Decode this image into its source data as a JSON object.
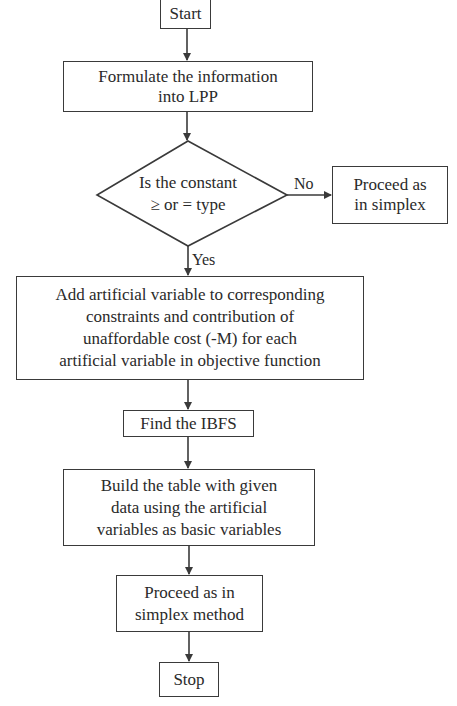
{
  "diagram": {
    "type": "flowchart",
    "nodes": {
      "start": {
        "label": "Start",
        "shape": "rectangle"
      },
      "formulate": {
        "label": "Formulate the information into LPP",
        "lines": [
          "Formulate the information",
          "into LPP"
        ],
        "shape": "rectangle"
      },
      "decision": {
        "label": "Is the constant ≥ or = type",
        "lines": [
          "Is the constant",
          "≥ or = type"
        ],
        "shape": "diamond"
      },
      "proceed_simplex": {
        "label": "Proceed as in simplex",
        "lines": [
          "Proceed as",
          "in simplex"
        ],
        "shape": "rectangle"
      },
      "add_artificial": {
        "label": "Add artificial variable to corresponding constraints and contribution of unaffordable cost (-M) for each artificial variable in objective function",
        "lines": [
          "Add artificial variable to corresponding",
          "constraints and contribution of",
          "unaffordable cost (-M) for each",
          "artificial variable in objective function"
        ],
        "shape": "rectangle"
      },
      "find_ibfs": {
        "label": "Find the IBFS",
        "shape": "rectangle"
      },
      "build_table": {
        "label": "Build the table with given data using the artificial variables as basic variables",
        "lines": [
          "Build the table with given",
          "data using the artificial",
          "variables as basic variables"
        ],
        "shape": "rectangle"
      },
      "proceed_method": {
        "label": "Proceed as in simplex method",
        "lines": [
          "Proceed as in",
          "simplex method"
        ],
        "shape": "rectangle"
      },
      "stop": {
        "label": "Stop",
        "shape": "rectangle"
      }
    },
    "edges": [
      {
        "from": "start",
        "to": "formulate",
        "label": ""
      },
      {
        "from": "formulate",
        "to": "decision",
        "label": ""
      },
      {
        "from": "decision",
        "to": "proceed_simplex",
        "label": "No"
      },
      {
        "from": "decision",
        "to": "add_artificial",
        "label": "Yes"
      },
      {
        "from": "add_artificial",
        "to": "find_ibfs",
        "label": ""
      },
      {
        "from": "find_ibfs",
        "to": "build_table",
        "label": ""
      },
      {
        "from": "build_table",
        "to": "proceed_method",
        "label": ""
      },
      {
        "from": "proceed_method",
        "to": "stop",
        "label": ""
      }
    ],
    "edge_labels": {
      "no": "No",
      "yes": "Yes"
    }
  },
  "colors": {
    "stroke": "#3a3a3a",
    "text": "#2a2a2a",
    "background": "#ffffff"
  }
}
